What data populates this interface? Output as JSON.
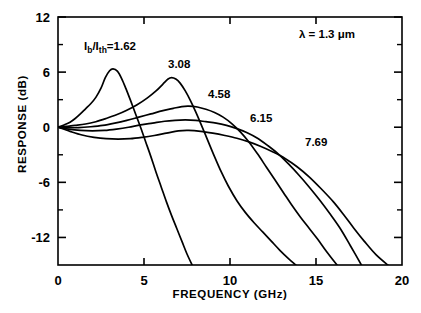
{
  "chart_data": {
    "type": "line",
    "title": "",
    "xlabel": "FREQUENCY (GHz)",
    "ylabel": "RESPONSE (dB)",
    "xlim": [
      0,
      20
    ],
    "ylim": [
      -15,
      12
    ],
    "xticks": [
      0,
      5,
      10,
      15,
      20
    ],
    "xticklabels": [
      "0",
      "5",
      "10",
      "15",
      "20"
    ],
    "yticks": [
      -12,
      -6,
      0,
      6,
      12
    ],
    "yticklabels": [
      "-12",
      "-6",
      "0",
      "6",
      "12"
    ],
    "minor_yticks": [
      -9,
      -3,
      3,
      9
    ],
    "grid": false,
    "legend": "inline-curve-labels",
    "annotations": [
      {
        "name": "wavelength",
        "text": "λ = 1.3 μm",
        "x": 15.7,
        "y": 9.4
      },
      {
        "name": "ratio-label",
        "text": "I",
        "sub": "b",
        "text2": "/I",
        "sub2": "th",
        "text3": "=1.62",
        "x": 2.0,
        "y": 8.2
      }
    ],
    "series": [
      {
        "name": "Ib/Ith = 1.62",
        "label": "1.62",
        "label_x": 2.0,
        "label_y": 8.2,
        "peak": {
          "f": 3.2,
          "r": 6.3
        },
        "exit_f": 7.85,
        "points": [
          [
            0.0,
            0.0
          ],
          [
            0.35,
            0.25
          ],
          [
            0.7,
            0.55
          ],
          [
            1.0,
            0.95
          ],
          [
            1.3,
            1.45
          ],
          [
            1.6,
            2.0
          ],
          [
            1.9,
            2.55
          ],
          [
            2.2,
            3.25
          ],
          [
            2.5,
            4.25
          ],
          [
            2.75,
            5.4
          ],
          [
            3.0,
            6.15
          ],
          [
            3.2,
            6.35
          ],
          [
            3.45,
            6.1
          ],
          [
            3.7,
            5.3
          ],
          [
            3.95,
            4.2
          ],
          [
            4.2,
            3.0
          ],
          [
            4.5,
            1.5
          ],
          [
            4.8,
            0.0
          ],
          [
            5.1,
            -1.6
          ],
          [
            5.4,
            -3.2
          ],
          [
            5.7,
            -4.9
          ],
          [
            6.0,
            -6.5
          ],
          [
            6.3,
            -8.1
          ],
          [
            6.6,
            -9.6
          ],
          [
            6.9,
            -11.0
          ],
          [
            7.2,
            -12.4
          ],
          [
            7.5,
            -13.8
          ],
          [
            7.85,
            -15.2
          ]
        ]
      },
      {
        "name": "Ib/Ith = 3.08",
        "label": "3.08",
        "label_x": 6.5,
        "label_y": 8.1,
        "peak": {
          "f": 6.6,
          "r": 5.4
        },
        "exit_f": 13.95,
        "points": [
          [
            0.0,
            0.0
          ],
          [
            0.5,
            0.1
          ],
          [
            1.0,
            0.2
          ],
          [
            1.6,
            0.35
          ],
          [
            2.2,
            0.6
          ],
          [
            2.8,
            0.95
          ],
          [
            3.4,
            1.35
          ],
          [
            4.0,
            1.85
          ],
          [
            4.6,
            2.45
          ],
          [
            5.2,
            3.2
          ],
          [
            5.7,
            3.95
          ],
          [
            6.1,
            4.7
          ],
          [
            6.4,
            5.25
          ],
          [
            6.6,
            5.4
          ],
          [
            6.85,
            5.25
          ],
          [
            7.1,
            4.8
          ],
          [
            7.4,
            3.95
          ],
          [
            7.7,
            2.9
          ],
          [
            8.0,
            1.7
          ],
          [
            8.3,
            0.4
          ],
          [
            8.7,
            -1.4
          ],
          [
            9.1,
            -3.2
          ],
          [
            9.5,
            -4.9
          ],
          [
            9.9,
            -6.4
          ],
          [
            10.4,
            -8.0
          ],
          [
            10.9,
            -9.3
          ],
          [
            11.4,
            -10.4
          ],
          [
            11.9,
            -11.4
          ],
          [
            12.4,
            -12.4
          ],
          [
            12.9,
            -13.4
          ],
          [
            13.4,
            -14.3
          ],
          [
            13.95,
            -15.2
          ]
        ]
      },
      {
        "name": "Ib/Ith = 4.58",
        "label": "4.58",
        "label_x": 9.0,
        "label_y": 4.6,
        "peak": {
          "f": 7.6,
          "r": 2.3
        },
        "exit_f": 16.3,
        "points": [
          [
            0.0,
            0.0
          ],
          [
            0.6,
            -0.05
          ],
          [
            1.2,
            -0.05
          ],
          [
            1.9,
            0.05
          ],
          [
            2.6,
            0.2
          ],
          [
            3.3,
            0.45
          ],
          [
            4.0,
            0.75
          ],
          [
            4.7,
            1.1
          ],
          [
            5.4,
            1.45
          ],
          [
            6.1,
            1.8
          ],
          [
            6.7,
            2.05
          ],
          [
            7.2,
            2.25
          ],
          [
            7.6,
            2.3
          ],
          [
            8.1,
            2.2
          ],
          [
            8.6,
            1.95
          ],
          [
            9.1,
            1.6
          ],
          [
            9.6,
            1.1
          ],
          [
            10.1,
            0.4
          ],
          [
            10.6,
            -0.5
          ],
          [
            11.1,
            -1.6
          ],
          [
            11.6,
            -2.9
          ],
          [
            12.1,
            -4.3
          ],
          [
            12.6,
            -5.7
          ],
          [
            13.1,
            -7.1
          ],
          [
            13.6,
            -8.5
          ],
          [
            14.1,
            -9.8
          ],
          [
            14.6,
            -11.0
          ],
          [
            15.1,
            -12.2
          ],
          [
            15.6,
            -13.5
          ],
          [
            16.3,
            -15.2
          ]
        ]
      },
      {
        "name": "Ib/Ith = 6.15",
        "label": "6.15",
        "label_x": 11.6,
        "label_y": 3.0,
        "peak": {
          "f": 7.4,
          "r": 0.8
        },
        "exit_f": 17.7,
        "points": [
          [
            0.0,
            0.0
          ],
          [
            0.6,
            -0.2
          ],
          [
            1.3,
            -0.35
          ],
          [
            2.0,
            -0.4
          ],
          [
            2.7,
            -0.35
          ],
          [
            3.4,
            -0.2
          ],
          [
            4.1,
            0.0
          ],
          [
            4.8,
            0.25
          ],
          [
            5.5,
            0.45
          ],
          [
            6.2,
            0.65
          ],
          [
            6.8,
            0.75
          ],
          [
            7.4,
            0.8
          ],
          [
            8.0,
            0.75
          ],
          [
            8.6,
            0.6
          ],
          [
            9.2,
            0.45
          ],
          [
            9.8,
            0.2
          ],
          [
            10.4,
            -0.15
          ],
          [
            11.0,
            -0.6
          ],
          [
            11.6,
            -1.2
          ],
          [
            12.2,
            -2.0
          ],
          [
            12.8,
            -2.9
          ],
          [
            13.4,
            -4.0
          ],
          [
            14.0,
            -5.2
          ],
          [
            14.6,
            -6.5
          ],
          [
            15.2,
            -7.9
          ],
          [
            15.8,
            -9.4
          ],
          [
            16.4,
            -11.0
          ],
          [
            17.0,
            -12.9
          ],
          [
            17.7,
            -15.2
          ]
        ]
      },
      {
        "name": "Ib/Ith = 7.69",
        "label": "7.69",
        "label_x": 14.8,
        "label_y": 1.3,
        "peak": {
          "f": 7.2,
          "r": -0.35
        },
        "exit_f": 19.3,
        "points": [
          [
            0.0,
            0.0
          ],
          [
            0.7,
            -0.45
          ],
          [
            1.4,
            -0.85
          ],
          [
            2.1,
            -1.1
          ],
          [
            2.8,
            -1.25
          ],
          [
            3.5,
            -1.3
          ],
          [
            4.2,
            -1.25
          ],
          [
            4.9,
            -1.1
          ],
          [
            5.6,
            -0.9
          ],
          [
            6.3,
            -0.65
          ],
          [
            7.0,
            -0.4
          ],
          [
            7.6,
            -0.35
          ],
          [
            8.3,
            -0.45
          ],
          [
            9.0,
            -0.65
          ],
          [
            9.7,
            -0.9
          ],
          [
            10.4,
            -1.2
          ],
          [
            11.1,
            -1.6
          ],
          [
            11.8,
            -2.1
          ],
          [
            12.5,
            -2.7
          ],
          [
            13.2,
            -3.4
          ],
          [
            13.9,
            -4.3
          ],
          [
            14.6,
            -5.4
          ],
          [
            15.3,
            -6.7
          ],
          [
            16.0,
            -8.1
          ],
          [
            16.6,
            -9.5
          ],
          [
            17.2,
            -11.0
          ],
          [
            17.8,
            -12.4
          ],
          [
            18.5,
            -13.9
          ],
          [
            19.3,
            -15.2
          ]
        ]
      }
    ]
  },
  "axes": {
    "ylabel_text": "RESPONSE (dB)",
    "xlabel_text": "FREQUENCY (GHz)"
  }
}
